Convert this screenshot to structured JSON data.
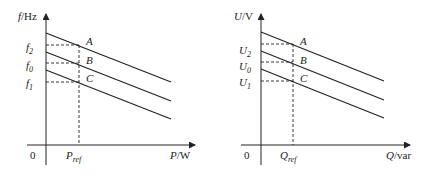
{
  "left_chart": {
    "y_axis_label": {
      "var": "f",
      "unit": "/Hz"
    },
    "x_axis_label": {
      "var": "P",
      "unit": "/W"
    },
    "origin": "0",
    "ref_label": {
      "var": "P",
      "sub": "ref"
    },
    "y_ticks": [
      {
        "var": "f",
        "sub": "2"
      },
      {
        "var": "f",
        "sub": "0"
      },
      {
        "var": "f",
        "sub": "1"
      }
    ],
    "points": [
      "A",
      "B",
      "C"
    ]
  },
  "right_chart": {
    "y_axis_label": {
      "var": "U",
      "unit": "/V"
    },
    "x_axis_label": {
      "var": "Q",
      "unit": "/var"
    },
    "origin": "0",
    "ref_label": {
      "var": "Q",
      "sub": "ref"
    },
    "y_ticks": [
      {
        "var": "U",
        "sub": "2"
      },
      {
        "var": "U",
        "sub": "0"
      },
      {
        "var": "U",
        "sub": "1"
      }
    ],
    "points": [
      "A",
      "B",
      "C"
    ]
  },
  "colors": {
    "line": "#222222",
    "background": "#ffffff"
  }
}
